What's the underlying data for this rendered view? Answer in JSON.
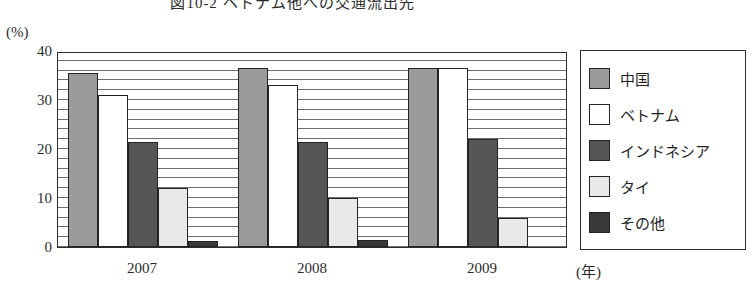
{
  "chart_data": {
    "type": "bar",
    "title": "図10-2 ベトナム他への交通流出先",
    "unit_label": "(%)",
    "xlabel": "(年)",
    "ylabel": "",
    "categories": [
      "2007",
      "2008",
      "2009"
    ],
    "ylim": [
      0,
      40
    ],
    "yticks": [
      0,
      10,
      20,
      30,
      40
    ],
    "ytick_labels": [
      "0",
      "10",
      "20",
      "30",
      "40"
    ],
    "grid": true,
    "grid_interval": 2,
    "legend_position": "right",
    "series": [
      {
        "name": "中国",
        "color": "#9b9b9b",
        "values": [
          35.5,
          36.5,
          36.5
        ]
      },
      {
        "name": "ベトナム",
        "color": "#ffffff",
        "values": [
          31.0,
          33.0,
          36.5
        ]
      },
      {
        "name": "インドネシア",
        "color": "#565656",
        "values": [
          21.5,
          21.5,
          22.0
        ]
      },
      {
        "name": "タイ",
        "color": "#e9e9e9",
        "values": [
          12.0,
          10.0,
          6.0
        ]
      },
      {
        "name": "その他",
        "color": "#3a3a3a",
        "values": [
          1.3,
          1.5,
          0.0
        ]
      }
    ]
  }
}
